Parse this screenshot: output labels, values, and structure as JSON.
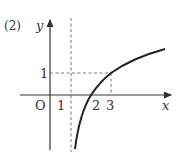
{
  "problem_label": "(2)",
  "axes": {
    "x_label": "x",
    "y_label": "y",
    "origin_label": "O"
  },
  "ticks": {
    "x": [
      "1",
      "2",
      "3"
    ],
    "y": [
      "1"
    ]
  },
  "function": "y = log_2(x - 1)",
  "asymptote": "x = 1",
  "reference_point": {
    "x": 3,
    "y": 1
  },
  "colors": {
    "curve": "#222222",
    "axis": "#333333",
    "dashed": "#666666"
  }
}
